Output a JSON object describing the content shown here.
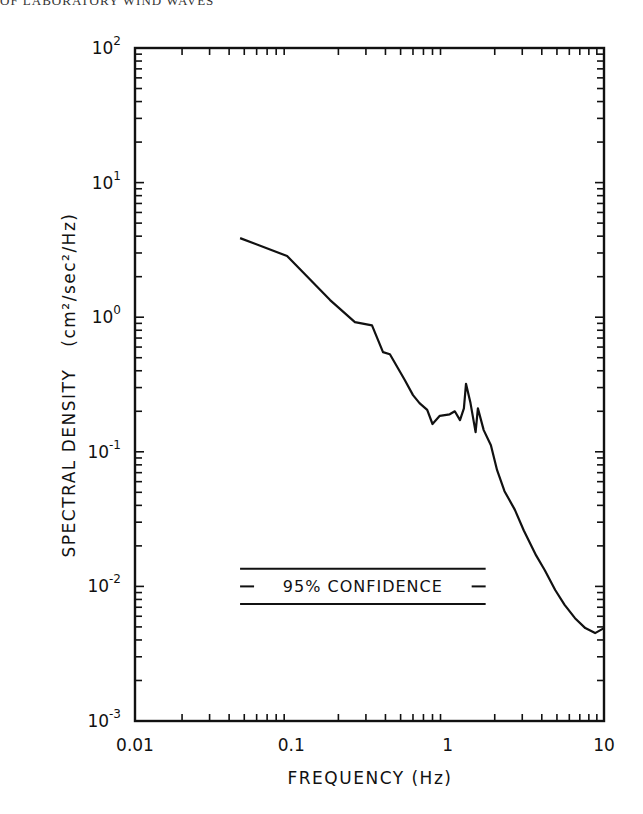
{
  "page": {
    "running_head": "OF LABORATORY WIND WAVES"
  },
  "chart_data": {
    "type": "line",
    "title": "",
    "xlabel": "FREQUENCY (Hz)",
    "ylabel": "SPECTRAL DENSITY",
    "ylabel_units": "(cm²/sec²/Hz)",
    "xscale": "log",
    "yscale": "log",
    "xlim": [
      0.01,
      10
    ],
    "ylim": [
      0.001,
      100
    ],
    "x_tick_labels": [
      "0.01",
      "0.1",
      "1",
      "10"
    ],
    "x_ticks": [
      0.01,
      0.1,
      1,
      10
    ],
    "y_tick_labels": [
      {
        "base": "10",
        "exp": "-3"
      },
      {
        "base": "10",
        "exp": "-2"
      },
      {
        "base": "10",
        "exp": "-1"
      },
      {
        "base": "10",
        "exp": "0"
      },
      {
        "base": "10",
        "exp": "1"
      },
      {
        "base": "10",
        "exp": "2"
      }
    ],
    "y_ticks": [
      0.001,
      0.01,
      0.1,
      1,
      10,
      100
    ],
    "grid": false,
    "legend": null,
    "annotations": [
      {
        "text": "95% CONFIDENCE",
        "type": "confidence-interval-bar",
        "x_range": [
          0.047,
          1.75
        ],
        "upper": 0.0135,
        "center": 0.01,
        "lower": 0.0074
      }
    ],
    "series": [
      {
        "name": "Spectral density",
        "x": [
          0.047,
          0.094,
          0.177,
          0.255,
          0.328,
          0.386,
          0.427,
          0.533,
          0.6,
          0.66,
          0.74,
          0.8,
          0.89,
          1.03,
          1.11,
          1.2,
          1.27,
          1.31,
          1.4,
          1.51,
          1.56,
          1.7,
          1.89,
          2.07,
          2.31,
          2.69,
          3.07,
          3.68,
          4.18,
          4.87,
          5.6,
          6.52,
          7.59,
          8.77,
          10.0
        ],
        "y": [
          3.87,
          2.85,
          1.34,
          0.92,
          0.87,
          0.55,
          0.53,
          0.34,
          0.264,
          0.23,
          0.205,
          0.161,
          0.185,
          0.19,
          0.2,
          0.172,
          0.21,
          0.32,
          0.23,
          0.14,
          0.21,
          0.145,
          0.112,
          0.073,
          0.051,
          0.037,
          0.026,
          0.017,
          0.0132,
          0.0094,
          0.0073,
          0.0058,
          0.0049,
          0.0045,
          0.0049
        ]
      }
    ]
  }
}
